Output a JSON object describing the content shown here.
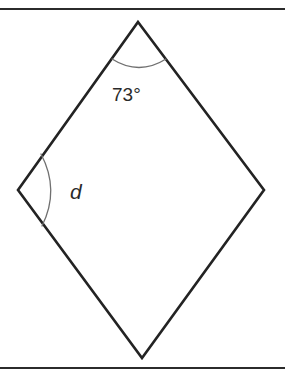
{
  "figure": {
    "type": "geometry-diagram",
    "shape_name": "kite-quadrilateral",
    "background_color": "#ffffff",
    "outline_color": "#232323",
    "arc_color": "#707070",
    "rule_color": "#2b2b2b",
    "vertices": {
      "top": {
        "x": 138,
        "y": 22
      },
      "left": {
        "x": 18,
        "y": 190
      },
      "right": {
        "x": 264,
        "y": 190
      },
      "bottom": {
        "x": 142,
        "y": 358
      }
    },
    "rules": {
      "top_rule_y": 9,
      "bottom_rule_y": 368
    },
    "angles": [
      {
        "id": "top-angle",
        "vertex": "top",
        "label": "73°",
        "label_x": 112,
        "label_y": 101,
        "arc_path": "M 112 59 Q 139 76 166 59"
      },
      {
        "id": "left-angle",
        "vertex": "left",
        "label": "d",
        "label_x": 70,
        "label_y": 199,
        "arc_path": "M 41 154 Q 60 190 42 226"
      }
    ]
  }
}
